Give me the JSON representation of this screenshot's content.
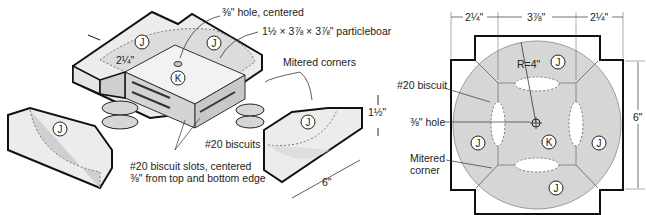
{
  "left_figure": {
    "labels": {
      "hole": "⅜\" hole, centered",
      "particleboard": "1½ × 3⅞ × 3⅞\" particleboar",
      "mitered_corners": "Mitered corners",
      "biscuits": "#20 biscuits",
      "slots_line1": "#20 biscuit slots, centered",
      "slots_line2": "⅜\" from top and bottom edge",
      "dim_width": "2¼\"",
      "dim_height": "1½\"",
      "dim_length": "6\""
    },
    "parts": {
      "j": "J",
      "k": "K"
    }
  },
  "right_figure": {
    "labels": {
      "biscuit": "#20 biscuit",
      "hole": "⅜\" hole",
      "mitered_line1": "Mitered",
      "mitered_line2": "corner",
      "radius": "R=4\""
    },
    "dims": {
      "left": "2¼\"",
      "center": "3⅞\"",
      "right": "2¼\"",
      "height": "6\""
    },
    "parts": {
      "j": "J",
      "k": "K"
    }
  },
  "colors": {
    "fill": "#d8d8d8",
    "fill_dark": "#bdbdbd",
    "stroke": "#111111"
  }
}
